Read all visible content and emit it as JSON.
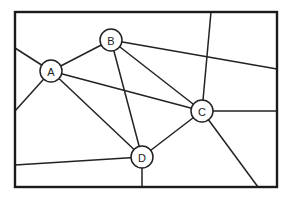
{
  "diagram": {
    "title": "",
    "frame": {
      "x": 15,
      "y": 12,
      "width": 262,
      "height": 175
    },
    "nodes": [
      {
        "id": "A",
        "label": "A",
        "x": 51,
        "y": 71,
        "r": 11
      },
      {
        "id": "B",
        "label": "B",
        "x": 111,
        "y": 40,
        "r": 11
      },
      {
        "id": "C",
        "label": "C",
        "x": 202,
        "y": 111,
        "r": 11
      },
      {
        "id": "D",
        "label": "D",
        "x": 142,
        "y": 157,
        "r": 11
      }
    ],
    "edges": [
      {
        "from": "A",
        "to": "B"
      },
      {
        "from": "A",
        "to": "C"
      },
      {
        "from": "A",
        "to": "D"
      },
      {
        "from": "B",
        "to": "C"
      },
      {
        "from": "B",
        "to": "D"
      },
      {
        "from": "C",
        "to": "D"
      },
      {
        "from": "A",
        "to": "border",
        "x2": 15,
        "y2": 48
      },
      {
        "from": "A",
        "to": "border",
        "x2": 15,
        "y2": 111
      },
      {
        "from": "B",
        "to": "border",
        "x2": 277,
        "y2": 69
      },
      {
        "from": "C",
        "to": "border",
        "x2": 211,
        "y2": 12
      },
      {
        "from": "C",
        "to": "border",
        "x2": 277,
        "y2": 111
      },
      {
        "from": "C",
        "to": "border",
        "x2": 258,
        "y2": 187
      },
      {
        "from": "D",
        "to": "border",
        "x2": 15,
        "y2": 165
      },
      {
        "from": "D",
        "to": "border",
        "x2": 142,
        "y2": 187
      }
    ],
    "colors": {
      "stroke": "#222222",
      "background": "#ffffff"
    }
  }
}
